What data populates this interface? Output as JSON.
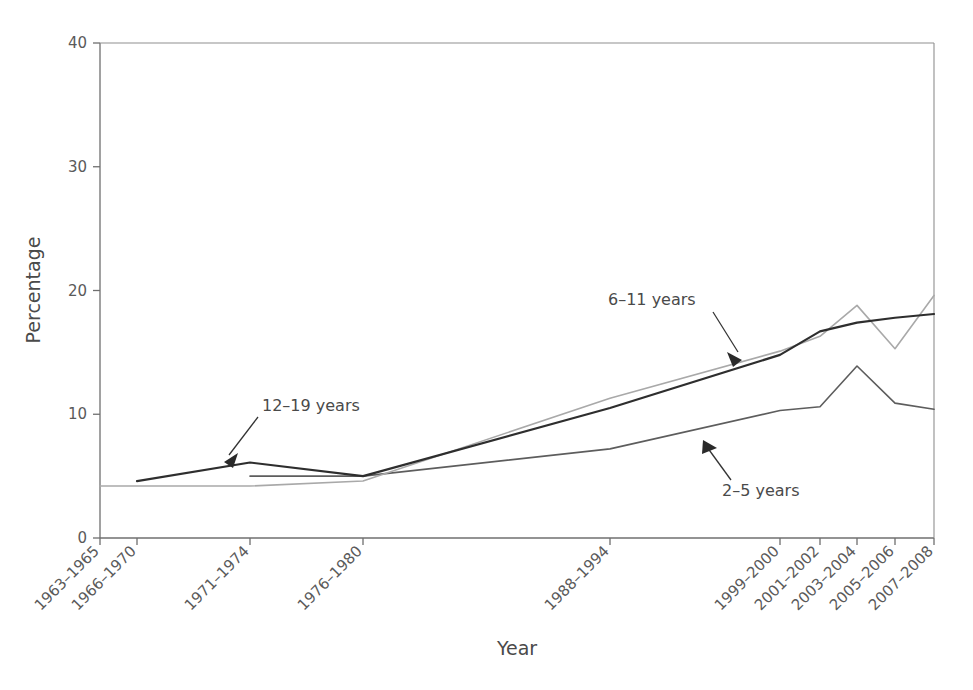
{
  "chart_data": {
    "type": "line",
    "title": "",
    "xlabel": "Year",
    "ylabel": "Percentage",
    "ylim": [
      0,
      40
    ],
    "yticks": [
      0,
      10,
      20,
      30,
      40
    ],
    "ytick_labels": [
      "0",
      "10",
      "20",
      "30",
      "40"
    ],
    "grid": false,
    "legend_position": "inline-annotations",
    "categories": [
      "1963–1965",
      "1966–1970",
      "1971–1974",
      "1976–1980",
      "1988–1994",
      "1999–2000",
      "2001–2002",
      "2003–2004",
      "2005–2006",
      "2007–2008"
    ],
    "series": [
      {
        "name": "2–5 years",
        "color": "#5d5d5d",
        "width": 1.6,
        "values": [
          null,
          null,
          5.0,
          5.0,
          7.2,
          10.3,
          10.6,
          13.9,
          10.9,
          10.4
        ]
      },
      {
        "name": "6–11 years",
        "color": "#a9a9a9",
        "width": 1.6,
        "values": [
          4.2,
          4.2,
          4.2,
          4.6,
          11.3,
          15.1,
          16.3,
          18.8,
          15.3,
          19.6
        ]
      },
      {
        "name": "12–19 years",
        "color": "#2e2e2e",
        "width": 2.2,
        "values": [
          null,
          4.6,
          6.1,
          5.0,
          10.5,
          14.8,
          16.7,
          17.4,
          17.8,
          18.1
        ]
      }
    ],
    "annotations": [
      {
        "text": "12–19 years",
        "series": "12–19 years"
      },
      {
        "text": "6–11 years",
        "series": "6–11 years"
      },
      {
        "text": "2–5 years",
        "series": "2–5 years"
      }
    ]
  },
  "axes": {
    "y_title": "Percentage",
    "x_title": "Year"
  }
}
